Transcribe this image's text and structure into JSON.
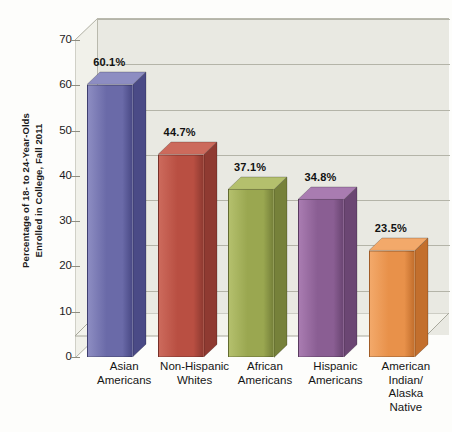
{
  "chart_data": {
    "type": "bar",
    "title": "",
    "subtitle": "",
    "xlabel": "",
    "ylabel": "Percentage of 18- to 24-Year-Olds Enrolled in College, Fall 2011",
    "ylabel_lines": [
      "Percentage of 18- to 24-Year-Olds",
      "Enrolled in College, Fall 2011"
    ],
    "categories": [
      "Asian Americans",
      "Non-Hispanic Whites",
      "African Americans",
      "Hispanic Americans",
      "American Indian/ Alaska Native"
    ],
    "category_lines": [
      [
        "Asian",
        "Americans"
      ],
      [
        "Non-Hispanic",
        "Whites"
      ],
      [
        "African",
        "Americans"
      ],
      [
        "Hispanic",
        "Americans"
      ],
      [
        "American",
        "Indian/",
        "Alaska",
        "Native"
      ]
    ],
    "values": [
      60.1,
      44.7,
      37.1,
      34.8,
      23.5
    ],
    "value_labels": [
      "60.1%",
      "44.7%",
      "37.1%",
      "34.8%",
      "23.5%"
    ],
    "bar_colors": [
      "#6a6aa8",
      "#b94f42",
      "#9aa750",
      "#8a5e93",
      "#e8914a"
    ],
    "bar_colors_dark": [
      "#4a4a86",
      "#8f3a31",
      "#76813a",
      "#6b4673",
      "#c36f2d"
    ],
    "bar_colors_light": [
      "#8d8dc2",
      "#cc6a5c",
      "#b4c06d",
      "#a97cb1",
      "#f3a96a"
    ],
    "ylim": [
      0,
      70
    ],
    "yticks": [
      0,
      10,
      20,
      30,
      40,
      50,
      60,
      70
    ],
    "ytick_labels": [
      "0",
      "10",
      "20",
      "30",
      "40",
      "50",
      "60",
      "70"
    ],
    "grid": true,
    "legend": false,
    "legend_position": "none",
    "plot_bgcolor": "#e9e9e2",
    "page_bgcolor": "#fdfdfb",
    "gridline_color": "#b4b4a8",
    "style": "3d-column"
  }
}
